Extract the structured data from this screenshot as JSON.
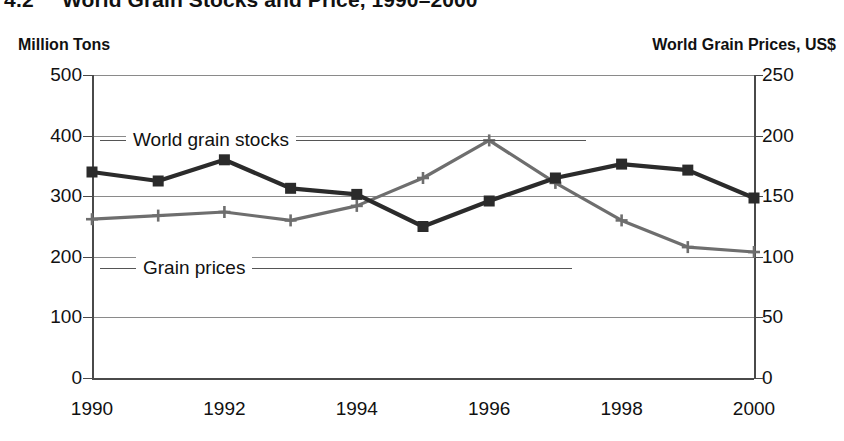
{
  "figure": {
    "number": "4.2",
    "title": "World Grain Stocks and Price, 1990–2000"
  },
  "axis_captions": {
    "left": "Million Tons",
    "right": "World Grain Prices, US$"
  },
  "annotations": {
    "stocks_label": "World grain stocks",
    "prices_label": "Grain prices"
  },
  "colors": {
    "stocks_line": "#2b2b2b",
    "prices_line": "#6e6e6e",
    "grid": "#8a8a8a",
    "axis": "#4a4a4a",
    "text": "#111111"
  },
  "chart_data": {
    "type": "line",
    "title": "World Grain Stocks and Price, 1990–2000",
    "xlabel": "",
    "x": [
      1990,
      1991,
      1992,
      1993,
      1994,
      1995,
      1996,
      1997,
      1998,
      1999,
      2000
    ],
    "x_tick_labels": [
      "1990",
      "1992",
      "1994",
      "1996",
      "1998",
      "2000"
    ],
    "x_tick_values": [
      1990,
      1992,
      1994,
      1996,
      1998,
      2000
    ],
    "xlim": [
      1990,
      2000
    ],
    "grid": true,
    "legend": "inline-annotations",
    "axes": [
      {
        "side": "left",
        "label": "Million Tons",
        "ylim": [
          0,
          500
        ],
        "ticks": [
          0,
          100,
          200,
          300,
          400,
          500
        ],
        "tick_labels": [
          "0",
          "100",
          "200",
          "300",
          "400",
          "500"
        ]
      },
      {
        "side": "right",
        "label": "World Grain Prices, US$",
        "ylim": [
          0,
          250
        ],
        "ticks": [
          0,
          50,
          100,
          150,
          200,
          250
        ],
        "tick_labels": [
          "0",
          "50",
          "100",
          "150",
          "200",
          "250"
        ]
      }
    ],
    "series": [
      {
        "name": "World grain stocks",
        "axis": "left",
        "unit": "Million Tons",
        "marker": "square",
        "color": "#2b2b2b",
        "values": [
          340,
          325,
          360,
          313,
          303,
          250,
          292,
          330,
          353,
          343,
          297
        ]
      },
      {
        "name": "Grain prices",
        "axis": "right",
        "unit": "US$",
        "marker": "plus",
        "color": "#6e6e6e",
        "values": [
          131,
          134,
          137,
          130,
          142,
          165,
          196,
          161,
          130,
          108,
          104
        ]
      }
    ]
  }
}
